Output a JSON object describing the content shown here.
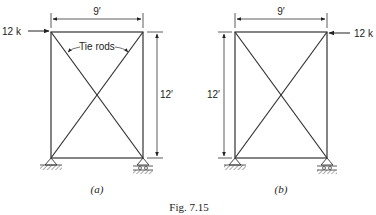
{
  "figure": {
    "caption": "Fig. 7.15",
    "panels": [
      {
        "id": "a",
        "label": "(a)",
        "width_dim": "9′",
        "height_dim": "12′",
        "load": "12 k",
        "load_side": "left",
        "annotation": "Tie rods",
        "left_support": "pin",
        "right_support": "roller"
      },
      {
        "id": "b",
        "label": "(b)",
        "width_dim": "9′",
        "height_dim": "12′",
        "load": "12 k",
        "load_side": "right",
        "left_support": "pin",
        "right_support": "roller"
      }
    ]
  },
  "colors": {
    "line": "#333333",
    "hatch": "#555555"
  }
}
